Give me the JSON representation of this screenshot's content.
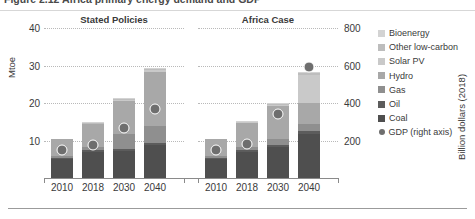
{
  "figure": {
    "title": "Figure 2.12   Africa primary energy demand and GDP",
    "left_axis_label": "Mtoe",
    "right_axis_label": "Billion dollars (2018)"
  },
  "chart_data": {
    "type": "bar",
    "title": "Figure 2.12   Africa primary energy demand and GDP",
    "stacked": true,
    "xlabel": "",
    "ylabel": "Mtoe",
    "y2label": "Billion dollars (2018)",
    "ylim": [
      0,
      40
    ],
    "y2lim": [
      0,
      800
    ],
    "yticks": [
      "10",
      "20",
      "30",
      "40"
    ],
    "ytick_values": [
      10,
      20,
      30,
      40
    ],
    "y2ticks": [
      "200",
      "400",
      "600",
      "800"
    ],
    "y2tick_values": [
      200,
      400,
      600,
      800
    ],
    "grid": true,
    "grid_style": "dotted horizontal",
    "legend_position": "right",
    "groups": [
      {
        "name": "Stated Policies",
        "categories": [
          "2010",
          "2018",
          "2030",
          "2040"
        ],
        "series": [
          {
            "name": "Coal",
            "values": [
              5.0,
              7.0,
              7.2,
              8.8
            ]
          },
          {
            "name": "Oil",
            "values": [
              0.4,
              0.4,
              0.5,
              0.6
            ]
          },
          {
            "name": "Gas",
            "values": [
              0.6,
              0.8,
              4.0,
              4.6
            ]
          },
          {
            "name": "Hydro",
            "values": [
              4.3,
              6.3,
              8.8,
              14.2
            ]
          },
          {
            "name": "Solar PV",
            "values": [
              0.0,
              0.2,
              0.4,
              0.6
            ]
          },
          {
            "name": "Other low-carbon",
            "values": [
              0.0,
              0.1,
              0.2,
              0.3
            ]
          },
          {
            "name": "Bioenergy",
            "values": [
              0.0,
              0.1,
              0.2,
              0.3
            ]
          }
        ],
        "gdp_right_axis": [
          180,
          205,
          295,
          400
        ]
      },
      {
        "name": "Africa Case",
        "categories": [
          "2010",
          "2018",
          "2030",
          "2040"
        ],
        "series": [
          {
            "name": "Coal",
            "values": [
              5.0,
              7.0,
              8.4,
              11.8
            ]
          },
          {
            "name": "Oil",
            "values": [
              0.4,
              0.4,
              0.5,
              0.7
            ]
          },
          {
            "name": "Gas",
            "values": [
              0.6,
              0.8,
              1.6,
              2.0
            ]
          },
          {
            "name": "Hydro",
            "values": [
              4.3,
              6.6,
              8.6,
              5.6
            ]
          },
          {
            "name": "Solar PV",
            "values": [
              0.0,
              0.2,
              0.5,
              7.4
            ]
          },
          {
            "name": "Other low-carbon",
            "values": [
              0.0,
              0.1,
              0.3,
              0.4
            ]
          },
          {
            "name": "Bioenergy",
            "values": [
              0.0,
              0.1,
              0.2,
              0.4
            ]
          }
        ],
        "gdp_right_axis": [
          180,
          212,
          370,
          620
        ]
      }
    ],
    "legend": [
      {
        "label": "Bioenergy",
        "color": "#d3d3d3",
        "marker": "square"
      },
      {
        "label": "Other low-carbon",
        "color": "#bdbdbd",
        "marker": "square"
      },
      {
        "label": "Solar PV",
        "color": "#c9c9c9",
        "marker": "square"
      },
      {
        "label": "Hydro",
        "color": "#a8a8a8",
        "marker": "square"
      },
      {
        "label": "Gas",
        "color": "#8f8f8f",
        "marker": "square"
      },
      {
        "label": "Oil",
        "color": "#5c5c5c",
        "marker": "square"
      },
      {
        "label": "Coal",
        "color": "#4f4f4f",
        "marker": "square"
      },
      {
        "label": "GDP (right axis)",
        "color": "#6e6e6e",
        "marker": "circle"
      }
    ]
  }
}
